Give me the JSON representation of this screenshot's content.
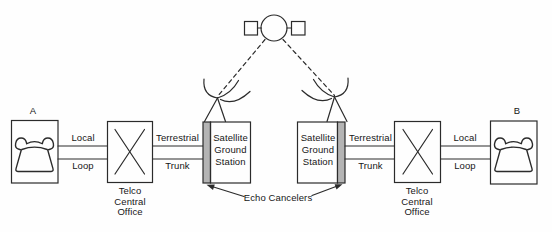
{
  "diagram": {
    "nodes": {
      "phone_a": {
        "label": "A"
      },
      "phone_b": {
        "label": "B"
      },
      "telco_left": {
        "caption": "Telco\nCentral\nOffice"
      },
      "telco_right": {
        "caption": "Telco\nCentral\nOffice"
      },
      "ground_station_left": {
        "caption": "Satellite\nGround\nStation"
      },
      "ground_station_right": {
        "caption": "Satellite\nGround\nStation"
      }
    },
    "links": {
      "left_loop": {
        "top": "Local",
        "bottom": "Loop"
      },
      "left_trunk": {
        "top": "Terrestrial",
        "bottom": "Trunk"
      },
      "right_trunk": {
        "top": "Terrestrial",
        "bottom": "Trunk"
      },
      "right_loop": {
        "top": "Local",
        "bottom": "Loop"
      }
    },
    "annotations": {
      "echo_cancelers": "Echo Cancelers"
    },
    "icons": {
      "satellite": "satellite-icon",
      "telephone": "telephone-icon",
      "antenna": "dish-antenna-icon",
      "switch": "switch-x-icon"
    },
    "colors": {
      "line": "#2b2b2b",
      "echo_canceler_strip": "#b4b4b4",
      "background": "#fefefe",
      "text": "#161616"
    }
  }
}
